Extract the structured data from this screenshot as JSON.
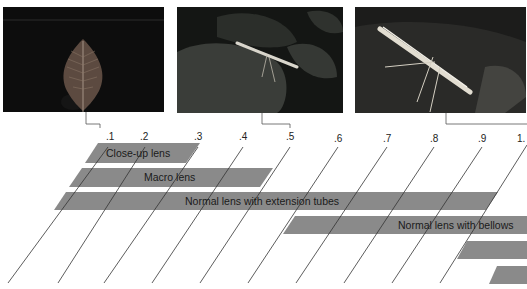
{
  "photos": [
    {
      "caption": "",
      "subject": "leaf",
      "scale_marker": ".1"
    },
    {
      "caption": "",
      "subject": "plume moth on leaf",
      "scale_marker": ".5"
    },
    {
      "caption": "",
      "subject": "plume moth close-up",
      "scale_marker": "1."
    }
  ],
  "scale": {
    "labels": [
      ".1",
      ".2",
      ".3",
      ".4",
      ".5",
      ".6",
      ".7",
      ".8",
      ".9",
      "1."
    ]
  },
  "bars": [
    {
      "label": "Close-up lens",
      "from": ".1",
      "to": ".3"
    },
    {
      "label": "Macro lens",
      "from": "0",
      "to": ".5"
    },
    {
      "label": "Normal lens with extension tubes",
      "from": "0",
      "to": ".9"
    },
    {
      "label": "Normal lens with bellows",
      "from": ".5",
      "to": "1.+"
    },
    {
      "label": "",
      "from": ".9",
      "to": "1.+"
    },
    {
      "label": "",
      "from": "1.",
      "to": "1.+"
    }
  ],
  "colors": {
    "bar": "#8a8a8a",
    "line": "#3a3a3a",
    "text": "#1a1a1a"
  }
}
